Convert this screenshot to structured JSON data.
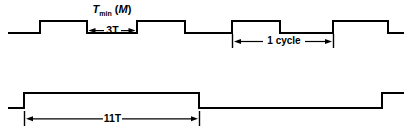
{
  "figure": {
    "title_label": {
      "main": "T",
      "subscript": "min",
      "suffix_open": " (",
      "variable": "M",
      "suffix_close": ")"
    },
    "annotations": {
      "three_t": "3T",
      "one_cycle": "1 cycle",
      "eleven_t": "11T"
    },
    "colors": {
      "stroke": "#000000",
      "background": "#ffffff"
    },
    "waveform_top": {
      "name": "clock-waveform",
      "high_y": 21,
      "low_y": 33,
      "start_x": 8,
      "end_x": 404,
      "transitions": [
        {
          "x": 40,
          "to": "high"
        },
        {
          "x": 87,
          "to": "low"
        },
        {
          "x": 137,
          "to": "high"
        },
        {
          "x": 185,
          "to": "low"
        },
        {
          "x": 232,
          "to": "high"
        },
        {
          "x": 280,
          "to": "low"
        },
        {
          "x": 333,
          "to": "high"
        },
        {
          "x": 388,
          "to": "low"
        }
      ]
    },
    "waveform_bottom": {
      "name": "long-pulse-waveform",
      "high_y": 93,
      "low_y": 108,
      "start_x": 8,
      "end_x": 404,
      "transitions": [
        {
          "x": 24,
          "to": "high"
        },
        {
          "x": 199,
          "to": "low"
        },
        {
          "x": 382,
          "to": "high"
        }
      ]
    },
    "dimensions": {
      "three_t": {
        "x1": 87,
        "x2": 137,
        "y": 31
      },
      "one_cycle": {
        "x1": 232,
        "x2": 333,
        "y": 42
      },
      "eleven_t": {
        "x1": 24,
        "x2": 199,
        "y": 119
      }
    }
  }
}
